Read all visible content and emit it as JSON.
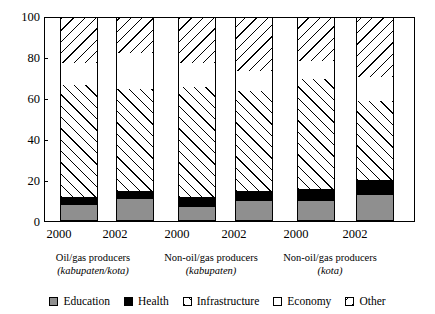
{
  "chart_data": {
    "type": "bar",
    "subtype": "stacked-bar-100-percent",
    "title": "",
    "subtitle": "",
    "xlabel": "",
    "ylabel": "",
    "ylim": [
      0,
      100
    ],
    "yticks": [
      0,
      20,
      40,
      60,
      80,
      100
    ],
    "ytick_labels": [
      "0",
      "20",
      "40",
      "60",
      "80",
      "100"
    ],
    "grid": false,
    "legend_position": "bottom",
    "categories": [
      "2000",
      "2002",
      "2000",
      "2002",
      "2000",
      "2002"
    ],
    "groups": [
      {
        "name": "Oil/gas producers",
        "sub": "(kabupaten/kota)",
        "years": [
          "2000",
          "2002"
        ]
      },
      {
        "name": "Non-oil/gas producers",
        "sub": "(kabupaten)",
        "years": [
          "2000",
          "2002"
        ]
      },
      {
        "name": "Non-oil/gas producers",
        "sub": "(kota)",
        "years": [
          "2000",
          "2002"
        ]
      }
    ],
    "series": [
      {
        "name": "Education",
        "pattern": "solid-gray",
        "color": "#8f8f8f",
        "values": [
          8,
          11,
          7,
          10,
          10,
          13
        ]
      },
      {
        "name": "Health",
        "pattern": "solid-black",
        "color": "#000000",
        "values": [
          4,
          4,
          5,
          5,
          6,
          7
        ]
      },
      {
        "name": "Infrastructure",
        "pattern": "forward-hatch",
        "color": "#ffffff",
        "values": [
          55,
          50,
          54,
          49,
          54,
          39
        ]
      },
      {
        "name": "Economy",
        "pattern": "empty",
        "color": "#ffffff",
        "values": [
          11,
          18,
          12,
          10,
          9,
          12
        ]
      },
      {
        "name": "Other",
        "pattern": "back-hatch",
        "color": "#ffffff",
        "values": [
          22,
          17,
          22,
          26,
          21,
          29
        ]
      }
    ],
    "cumulative_tops": [
      [
        8,
        12,
        67,
        78,
        100
      ],
      [
        11,
        15,
        65,
        83,
        100
      ],
      [
        7,
        12,
        66,
        78,
        100
      ],
      [
        10,
        15,
        64,
        74,
        100
      ],
      [
        10,
        16,
        70,
        79,
        100
      ],
      [
        13,
        20,
        59,
        71,
        100
      ]
    ]
  },
  "legend": {
    "items": [
      {
        "label": "Education",
        "key": "education"
      },
      {
        "label": "Health",
        "key": "health"
      },
      {
        "label": "Infrastructure",
        "key": "infrastructure"
      },
      {
        "label": "Economy",
        "key": "economy"
      },
      {
        "label": "Other",
        "key": "other"
      }
    ]
  }
}
